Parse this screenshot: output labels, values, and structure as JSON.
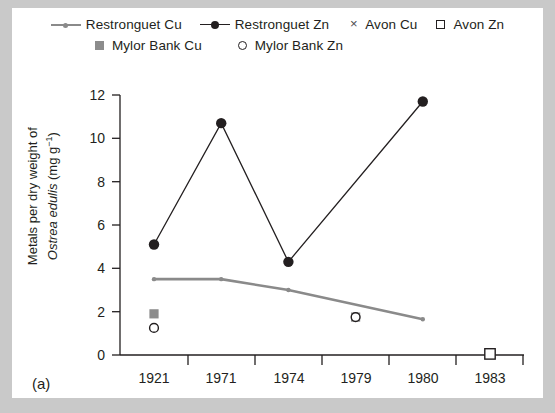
{
  "figure": {
    "panel_label": "(a)"
  },
  "legend": {
    "rows": [
      [
        {
          "label": "Restronguet Cu",
          "marker": "line-grey-dot",
          "color": "#8a8a8a"
        },
        {
          "label": "Restronguet Zn",
          "marker": "line-black-filled-circle",
          "color": "#231f20"
        },
        {
          "label": "Avon Cu",
          "marker": "x-cross",
          "color": "#4d4d4d"
        },
        {
          "label": "Avon Zn",
          "marker": "open-square",
          "color": "#231f20"
        }
      ],
      [
        {
          "label": "Mylor Bank Cu",
          "marker": "filled-square",
          "color": "#8c8c8c"
        },
        {
          "label": "Mylor Bank Zn",
          "marker": "open-circle",
          "color": "#231f20"
        }
      ]
    ]
  },
  "axes": {
    "y_title_line1": "Metals per dry weight of",
    "y_title_line2_italic": "Ostrea edulis",
    "y_title_line2_rest": " (mg g",
    "y_title_sup": "−1",
    "y_title_close": ")",
    "y_ticks": [
      "0",
      "2",
      "4",
      "6",
      "8",
      "10",
      "12"
    ],
    "x_ticks": [
      "1921",
      "1971",
      "1974",
      "1979",
      "1980",
      "1983"
    ]
  },
  "chart_data": {
    "type": "line",
    "title": "",
    "xlabel": "",
    "ylabel": "Metals per dry weight of Ostrea edulis (mg g−1)",
    "categories": [
      "1921",
      "1971",
      "1974",
      "1979",
      "1980",
      "1983"
    ],
    "ylim": [
      0,
      12
    ],
    "ytick_step": 2,
    "grid": false,
    "legend_position": "top",
    "series": [
      {
        "name": "Restronguet Cu",
        "style": "line+marker",
        "color": "#8a8a8a",
        "marker": "small-dot",
        "x": [
          "1921",
          "1971",
          "1974",
          "1980"
        ],
        "values": [
          3.5,
          3.5,
          3.0,
          1.65
        ]
      },
      {
        "name": "Restronguet Zn",
        "style": "line+marker",
        "color": "#231f20",
        "marker": "filled-circle",
        "x": [
          "1921",
          "1971",
          "1974",
          "1980"
        ],
        "values": [
          5.1,
          10.7,
          4.3,
          11.7
        ]
      },
      {
        "name": "Avon Cu",
        "style": "marker-only",
        "color": "#4d4d4d",
        "marker": "x-cross",
        "x": [
          "1983"
        ],
        "values": [
          0.05
        ]
      },
      {
        "name": "Avon Zn",
        "style": "marker-only",
        "color": "#231f20",
        "marker": "open-square",
        "x": [
          "1983"
        ],
        "values": [
          0.05
        ]
      },
      {
        "name": "Mylor Bank Cu",
        "style": "marker-only",
        "color": "#8c8c8c",
        "marker": "filled-square",
        "x": [
          "1921",
          "1979"
        ],
        "values": [
          1.9,
          1.75
        ]
      },
      {
        "name": "Mylor Bank Zn",
        "style": "marker-only",
        "color": "#231f20",
        "marker": "open-circle",
        "x": [
          "1921",
          "1979"
        ],
        "values": [
          1.25,
          1.75
        ]
      }
    ]
  }
}
